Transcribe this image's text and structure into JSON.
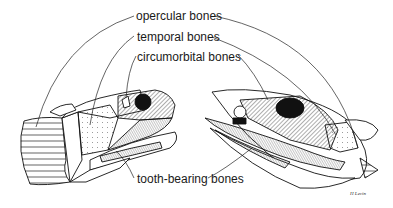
{
  "diagram": {
    "labels": {
      "opercular": "opercular bones",
      "temporal": "temporal bones",
      "circumorbital": "circumorbital bones",
      "tooth_bearing": "tooth-bearing bones"
    },
    "signature": "H Levin",
    "legend_patterns": {
      "opercular": "horizontal lines",
      "temporal": "dots",
      "circumorbital": "diagonal hatching",
      "tooth_bearing": "fine cross-hatching"
    }
  }
}
